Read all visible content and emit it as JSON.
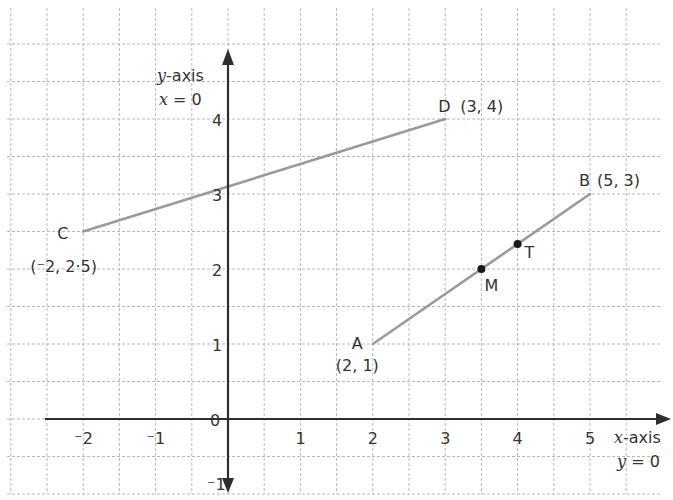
{
  "chart_data": {
    "type": "scatter",
    "title": "",
    "xlabel": "x-axis",
    "xlabel_eq": "y = 0",
    "ylabel": "y-axis",
    "ylabel_eq": "x = 0",
    "xlim": [
      -2.5,
      6
    ],
    "ylim": [
      -1,
      5
    ],
    "grid": true,
    "grid_step": 0.5,
    "x_ticks": [
      {
        "value": -2,
        "label": "⁻2"
      },
      {
        "value": -1,
        "label": "⁻1"
      },
      {
        "value": 1,
        "label": "1"
      },
      {
        "value": 2,
        "label": "2"
      },
      {
        "value": 3,
        "label": "3"
      },
      {
        "value": 4,
        "label": "4"
      },
      {
        "value": 5,
        "label": "5"
      }
    ],
    "y_ticks": [
      {
        "value": 1,
        "label": "1"
      },
      {
        "value": 2,
        "label": "2"
      },
      {
        "value": 3,
        "label": "3"
      },
      {
        "value": 4,
        "label": "4"
      },
      {
        "value": -1,
        "label": "⁻1"
      }
    ],
    "origin_label": "0",
    "points": [
      {
        "name": "A",
        "x": 2,
        "y": 1,
        "coord_label": "(2, 1)"
      },
      {
        "name": "B",
        "x": 5,
        "y": 3,
        "coord_label": "(5, 3)"
      },
      {
        "name": "C",
        "x": -2,
        "y": 2.5,
        "coord_label": "(⁻2, 2·5)"
      },
      {
        "name": "D",
        "x": 3,
        "y": 4,
        "coord_label": "(3, 4)"
      },
      {
        "name": "M",
        "x": 3.5,
        "y": 2,
        "coord_label": ""
      },
      {
        "name": "T",
        "x": 4,
        "y": 2.333,
        "coord_label": ""
      }
    ],
    "segments": [
      {
        "from": "A",
        "to": "B"
      },
      {
        "from": "C",
        "to": "D"
      }
    ],
    "marked_points": [
      "M",
      "T"
    ]
  },
  "colors": {
    "grid": "#b8b8b8",
    "axis": "#2e2e2e",
    "segment": "#9a9a9a",
    "point": "#1a1a1a",
    "text": "#333333"
  }
}
